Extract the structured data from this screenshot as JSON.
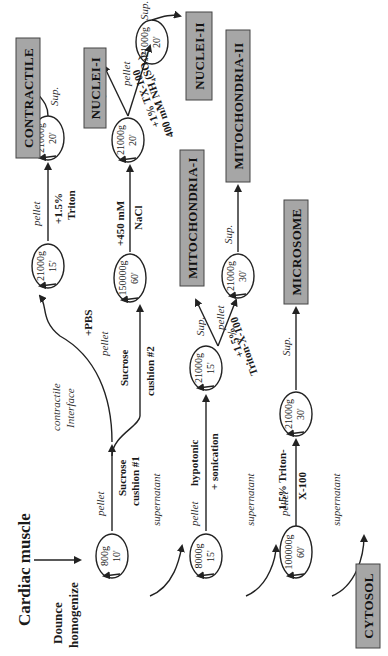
{
  "diagram": {
    "title": "Cardiac muscle",
    "start_step": "Dounce homogenize",
    "orientation": "rotated 90° counter-clockwise",
    "centrifugations": [
      {
        "id": "c1",
        "speed": "800g",
        "time": "10'"
      },
      {
        "id": "c2",
        "speed": "8000g",
        "time": "15'"
      },
      {
        "id": "c3",
        "speed": "100000g",
        "time": "60'"
      },
      {
        "id": "c4",
        "speed": "21000g",
        "time": "15'"
      },
      {
        "id": "c5",
        "speed": "21000g",
        "time": "20'"
      },
      {
        "id": "c6",
        "speed": "150000g",
        "time": "60'"
      },
      {
        "id": "c7",
        "speed": "21000g",
        "time": "20'"
      },
      {
        "id": "c8",
        "speed": "21000g",
        "time": "20'"
      },
      {
        "id": "c9",
        "speed": "21000g",
        "time": "15'"
      },
      {
        "id": "c10",
        "speed": "21000g",
        "time": "30'"
      },
      {
        "id": "c11",
        "speed": "21000g",
        "time": "30'"
      }
    ],
    "labels": {
      "pellet": "pellet",
      "supernatant": "supernatant",
      "sup": "Sup.",
      "sucrose1": [
        "Sucrose",
        "cushion #1"
      ],
      "sucrose2": [
        "Sucrose",
        "cushion #2"
      ],
      "contractile_interface": [
        "contractile",
        "Interface"
      ],
      "pbs": "+PBS",
      "triton15": [
        "+1.5%",
        "Triton"
      ],
      "nacl": [
        "+450 mM",
        "NaCl"
      ],
      "tx100_ammonium": [
        "+1% TX-100",
        "400 mM NH₄(SO₄)₂"
      ],
      "hypotonic": [
        "hypotonic",
        "+ sonication"
      ],
      "triton_x100_mito": [
        "+1.5%",
        "Triton-X-100"
      ],
      "triton_x100_micro": [
        "1.5% Triton-",
        "X-100"
      ]
    },
    "fractions": [
      {
        "name": "CONTRACTILE"
      },
      {
        "name": "NUCLEI-I"
      },
      {
        "name": "NUCLEI-II"
      },
      {
        "name": "MITOCHONDRIA-I"
      },
      {
        "name": "MITOCHONDRIA-II"
      },
      {
        "name": "MICROSOME"
      },
      {
        "name": "CYTOSOL"
      }
    ],
    "colors": {
      "box_fill": "#a6a6a6",
      "line": "#222222"
    }
  }
}
